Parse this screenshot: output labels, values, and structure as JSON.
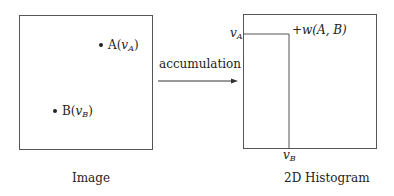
{
  "left_panel": {
    "caption": "Image",
    "point_a": {
      "name": "A",
      "open": "(",
      "var": "v",
      "sub": "A",
      "close": ")"
    },
    "point_b": {
      "name": "B",
      "open": "(",
      "var": "v",
      "sub": "B",
      "close": ")"
    }
  },
  "arrow": {
    "label": "accumulation"
  },
  "right_panel": {
    "caption": "2D Histogram",
    "y_marker": {
      "var": "v",
      "sub": "A"
    },
    "x_marker": {
      "var": "v",
      "sub": "B"
    },
    "increment_label": "+w(A, B)"
  }
}
